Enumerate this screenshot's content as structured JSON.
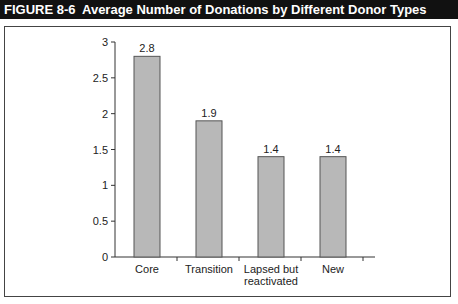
{
  "figure": {
    "number": "FIGURE 8-6",
    "title": "Average Number of Donations by Different Donor Types"
  },
  "colors": {
    "header_bg": "#111111",
    "bar_fill": "#b8b8b8",
    "bar_stroke": "#555555",
    "axis": "#333333"
  },
  "chart_data": {
    "type": "bar",
    "title": "Average Number of Donations by Different Donor Types",
    "categories": [
      "Core",
      "Transition",
      "Lapsed but reactivated",
      "New"
    ],
    "category_lines": [
      [
        "Core"
      ],
      [
        "Transition"
      ],
      [
        "Lapsed but",
        "reactivated"
      ],
      [
        "New"
      ]
    ],
    "values": [
      2.8,
      1.9,
      1.4,
      1.4
    ],
    "value_labels": [
      "2.8",
      "1.9",
      "1.4",
      "1.4"
    ],
    "xlabel": "",
    "ylabel": "",
    "ylim": [
      0,
      3
    ],
    "yticks": [
      0,
      0.5,
      1,
      1.5,
      2,
      2.5,
      3
    ],
    "ytick_labels": [
      "0",
      "0.5",
      "1",
      "1.5",
      "2",
      "2.5",
      "3"
    ],
    "grid": false,
    "legend": null
  }
}
